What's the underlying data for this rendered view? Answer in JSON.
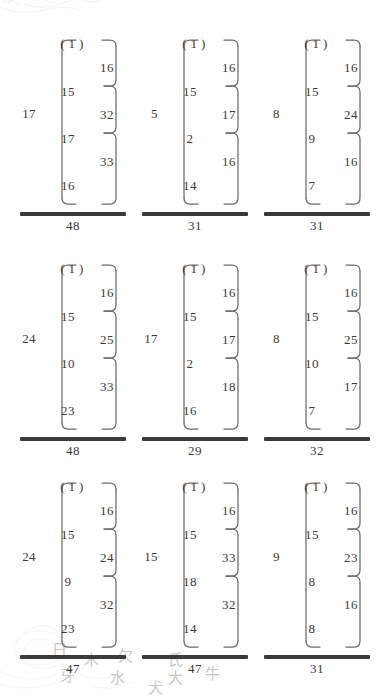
{
  "page": {
    "ink_color": "#3a3a3a",
    "rule_color": "#3b3b3b",
    "background": "#ffffff"
  },
  "watermark": {
    "cloud_icon": "cloud-scroll-ornament",
    "flower_icon": "lotus-flower-ornament",
    "characters": [
      "日",
      "木",
      "欠",
      "氏",
      "水",
      "大",
      "牙",
      "牛",
      "犬"
    ]
  },
  "legend": {
    "root_note": "value at left of outer bracket",
    "top_node": "(1)"
  },
  "chart_data": {
    "type": "diagram",
    "subtype": "bracket-tree-grid",
    "grid": {
      "rows": 3,
      "cols": 3
    },
    "node_labels_per_diagram": 4,
    "edge_labels_per_diagram": 3,
    "diagrams": [
      {
        "id": "r1c1",
        "root": "17",
        "nodes": [
          "( 1 )",
          "15",
          "17",
          "16"
        ],
        "edges": [
          "16",
          "32",
          "33"
        ],
        "total": "48"
      },
      {
        "id": "r1c2",
        "root": "5",
        "nodes": [
          "( 1 )",
          "15",
          "2",
          "14"
        ],
        "edges": [
          "16",
          "17",
          "16"
        ],
        "total": "31"
      },
      {
        "id": "r1c3",
        "root": "8",
        "nodes": [
          "( 1 )",
          "15",
          "9",
          "7"
        ],
        "edges": [
          "16",
          "24",
          "16"
        ],
        "total": "31"
      },
      {
        "id": "r2c1",
        "root": "24",
        "nodes": [
          "( 1 )",
          "15",
          "10",
          "23"
        ],
        "edges": [
          "16",
          "25",
          "33"
        ],
        "total": "48"
      },
      {
        "id": "r2c2",
        "root": "17",
        "nodes": [
          "( 1 )",
          "15",
          "2",
          "16"
        ],
        "edges": [
          "16",
          "17",
          "18"
        ],
        "total": "29"
      },
      {
        "id": "r2c3",
        "root": "8",
        "nodes": [
          "( 1 )",
          "15",
          "10",
          "7"
        ],
        "edges": [
          "16",
          "25",
          "17"
        ],
        "total": "32"
      },
      {
        "id": "r3c1",
        "root": "24",
        "nodes": [
          "( 1 )",
          "15",
          "9",
          "23"
        ],
        "edges": [
          "16",
          "24",
          "32"
        ],
        "total": "47"
      },
      {
        "id": "r3c2",
        "root": "15",
        "nodes": [
          "( 1 )",
          "15",
          "18",
          "14"
        ],
        "edges": [
          "16",
          "33",
          "32"
        ],
        "total": "47"
      },
      {
        "id": "r3c3",
        "root": "9",
        "nodes": [
          "( 1 )",
          "15",
          "8",
          "8"
        ],
        "edges": [
          "16",
          "23",
          "16"
        ],
        "total": "31"
      }
    ]
  }
}
